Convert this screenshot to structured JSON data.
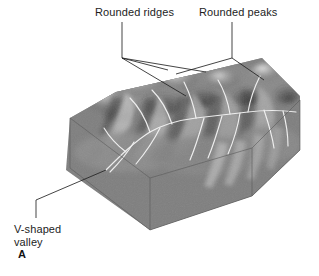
{
  "figure": {
    "letter": "A",
    "type": "geologic-block-diagram",
    "palette": {
      "background": "#ffffff",
      "block_left_face": "#7c7c7c",
      "block_front_face": "#6e6e6e",
      "block_right_face": "#5f5f5f",
      "terrain_mid": "#8a8a8a",
      "terrain_highlight": "#e6e6e6",
      "terrain_shadow": "#3a3a3a",
      "stream_line": "#f2f2f2",
      "leader_line": "#2b2b2b",
      "text": "#1d1d1d"
    },
    "labels": [
      {
        "id": "rounded-ridges",
        "text": "Rounded ridges",
        "position": "top-left"
      },
      {
        "id": "rounded-peaks",
        "text": "Rounded peaks",
        "position": "top-right"
      },
      {
        "id": "v-shaped-valley",
        "text": "V-shaped\nvalley",
        "position": "bottom-left"
      }
    ]
  }
}
